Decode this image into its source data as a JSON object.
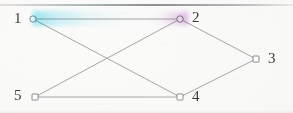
{
  "diagram": {
    "type": "graph",
    "title": "",
    "background_color": "#fbfbfa",
    "edge_color": "#8e8e90",
    "node_stroke_color": "#6f6f72",
    "node_fill_color": "#ffffff",
    "label_color": "#3a3a3c",
    "top_rule_color": "#787d80",
    "highlight_colors": {
      "node1_glow": "#78e1f5",
      "node2_glow": "#cd91d7"
    },
    "nodes": [
      {
        "id": "1",
        "label": "1",
        "x": 33,
        "y": 19,
        "label_x": 14,
        "label_y": 11,
        "shape": "circle",
        "r": 3.2,
        "glow": "cyan"
      },
      {
        "id": "2",
        "label": "2",
        "x": 180,
        "y": 19,
        "label_x": 192,
        "label_y": 10,
        "shape": "circle",
        "r": 3.2,
        "glow": "magenta"
      },
      {
        "id": "3",
        "label": "3",
        "x": 256,
        "y": 59,
        "label_x": 268,
        "label_y": 51,
        "shape": "square",
        "r": 3.0,
        "glow": "none"
      },
      {
        "id": "4",
        "label": "4",
        "x": 180,
        "y": 97,
        "label_x": 192,
        "label_y": 89,
        "shape": "square",
        "r": 3.0,
        "glow": "none"
      },
      {
        "id": "5",
        "label": "5",
        "x": 35,
        "y": 97,
        "label_x": 14,
        "label_y": 88,
        "shape": "square",
        "r": 3.0,
        "glow": "none"
      }
    ],
    "edges": [
      {
        "from": "1",
        "to": "2"
      },
      {
        "from": "1",
        "to": "4"
      },
      {
        "from": "5",
        "to": "2"
      },
      {
        "from": "2",
        "to": "3"
      },
      {
        "from": "3",
        "to": "4"
      },
      {
        "from": "5",
        "to": "4"
      }
    ]
  }
}
